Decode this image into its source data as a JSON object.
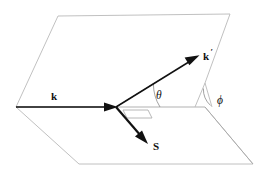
{
  "figure": {
    "background_color": "#ffffff",
    "line_color": "#b9b9b9",
    "vector_color": "#111111"
  },
  "labels": {
    "k": "k",
    "k_prime": "k",
    "k_prime_mark": "′",
    "S": "S",
    "theta": "θ",
    "phi": "ϕ"
  },
  "geometry": {
    "origin": [
      116,
      107
    ],
    "left_vertex": [
      16,
      107
    ],
    "phi_vertex": [
      205,
      83
    ],
    "base_plane_points": "16,107 205,107 253,164 79,164",
    "upper_plane_points": "16,107 58,16 230,14 205,83",
    "k_vector": {
      "from": [
        16,
        107
      ],
      "to": [
        116,
        107
      ]
    },
    "k_prime_vector": {
      "from": [
        116,
        107
      ],
      "to": [
        198,
        56
      ]
    },
    "s_vector": {
      "from": [
        116,
        107
      ],
      "to": [
        147,
        143
      ]
    },
    "theta_arc_radius": 44,
    "phi_arc": {
      "start": [
        203,
        86
      ],
      "end": [
        209,
        106
      ]
    }
  },
  "elements": {
    "base_plane": "scattering-plane",
    "upper_plane": "reference-plane",
    "right_angle_marker": "right-angle-marker"
  }
}
